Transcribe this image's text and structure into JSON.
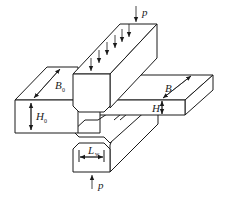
{
  "diagram": {
    "labels": {
      "load_top": "p",
      "load_bottom": "p",
      "plate_width_left": "B",
      "plate_width_left_sub": "0",
      "plate_height_left": "H",
      "plate_height_left_sub": "0",
      "plate_width_right": "B",
      "plate_height_right": "H",
      "punch_width": "L",
      "punch_width_sub": "w"
    },
    "colors": {
      "line": "#1a1a1a",
      "background": "#ffffff"
    }
  }
}
